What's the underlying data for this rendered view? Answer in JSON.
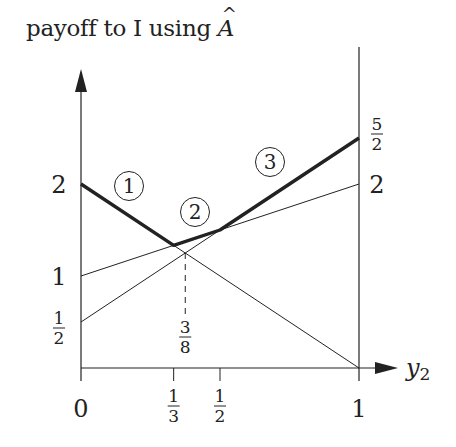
{
  "chart_data": {
    "type": "line",
    "title": "",
    "ylabel": {
      "prefix": "payoff to I using ",
      "symbol": "A",
      "symbol_accent": "^"
    },
    "xlabel": {
      "base": "y",
      "subscript": "2"
    },
    "xlim": [
      0,
      1
    ],
    "ylim": [
      0,
      2.5
    ],
    "grid": false,
    "legend": "none",
    "x_ticks": [
      {
        "value": 0,
        "label": "0",
        "kind": "int"
      },
      {
        "value": 0.3333,
        "num": "1",
        "den": "3",
        "kind": "frac"
      },
      {
        "value": 0.5,
        "num": "1",
        "den": "2",
        "kind": "frac"
      },
      {
        "value": 1,
        "label": "1",
        "kind": "int"
      }
    ],
    "y_ticks_left": [
      {
        "value": 2,
        "label": "2",
        "kind": "int"
      },
      {
        "value": 1,
        "label": "1",
        "kind": "int"
      },
      {
        "value": 0.5,
        "num": "1",
        "den": "2",
        "kind": "frac"
      }
    ],
    "y_ticks_right": [
      {
        "value": 2.5,
        "num": "5",
        "den": "2",
        "kind": "frac"
      },
      {
        "value": 2,
        "label": "2",
        "kind": "int"
      }
    ],
    "series": [
      {
        "name": "line-A",
        "x": [
          0,
          1
        ],
        "y": [
          2,
          0
        ],
        "style": "thin"
      },
      {
        "name": "line-B",
        "x": [
          0,
          1
        ],
        "y": [
          1,
          2
        ],
        "style": "thin"
      },
      {
        "name": "line-C",
        "x": [
          0,
          1
        ],
        "y": [
          0.5,
          2.5
        ],
        "style": "thin"
      },
      {
        "name": "upper-envelope",
        "x": [
          0,
          0.3333,
          0.5,
          1
        ],
        "y": [
          2,
          1.3333,
          1.5,
          2.5
        ],
        "style": "bold"
      }
    ],
    "annotations": [
      {
        "type": "dashed-vline",
        "x": 0.375,
        "y_from": 0,
        "y_to": 1.25,
        "num": "3",
        "den": "8"
      },
      {
        "type": "circled-label",
        "text": "1",
        "px": [
          129,
          186
        ]
      },
      {
        "type": "circled-label",
        "text": "2",
        "px": [
          195,
          212
        ]
      },
      {
        "type": "circled-label",
        "text": "3",
        "px": [
          270,
          162
        ]
      }
    ],
    "colors": {
      "line": "#222222",
      "background": "#ffffff"
    }
  }
}
